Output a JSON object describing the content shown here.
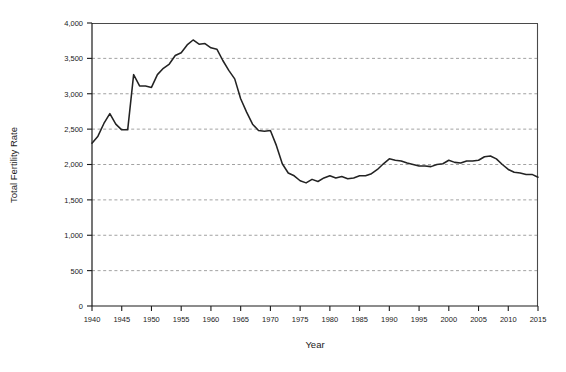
{
  "chart_data": {
    "type": "line",
    "title": "",
    "xlabel": "Year",
    "ylabel": "Total Fertility Rate",
    "xlim": [
      1940,
      2015
    ],
    "ylim": [
      0,
      4000
    ],
    "grid": true,
    "legend": "none",
    "xticks": [
      1940,
      1945,
      1950,
      1955,
      1960,
      1965,
      1970,
      1975,
      1980,
      1985,
      1990,
      1995,
      2000,
      2005,
      2010,
      2015
    ],
    "xtick_labels": [
      "1940",
      "1945",
      "1950",
      "1955",
      "1960",
      "1965",
      "1970",
      "1975",
      "1980",
      "1985",
      "1990",
      "1995",
      "2000",
      "2005",
      "2010",
      "2015"
    ],
    "yticks": [
      0,
      500,
      1000,
      1500,
      2000,
      2500,
      3000,
      3500,
      4000
    ],
    "ytick_labels": [
      "0",
      "500",
      "1,000",
      "1,500",
      "2,000",
      "2,500",
      "3,000",
      "3,500",
      "4,000"
    ],
    "line_color": "#232323",
    "series": [
      {
        "name": "Total Fertility Rate",
        "x": [
          1940,
          1941,
          1942,
          1943,
          1944,
          1945,
          1946,
          1947,
          1948,
          1949,
          1950,
          1951,
          1952,
          1953,
          1954,
          1955,
          1956,
          1957,
          1958,
          1959,
          1960,
          1961,
          1962,
          1963,
          1964,
          1965,
          1966,
          1967,
          1968,
          1969,
          1970,
          1971,
          1972,
          1973,
          1974,
          1975,
          1976,
          1977,
          1978,
          1979,
          1980,
          1981,
          1982,
          1983,
          1984,
          1985,
          1986,
          1987,
          1988,
          1989,
          1990,
          1991,
          1992,
          1993,
          1994,
          1995,
          1996,
          1997,
          1998,
          1999,
          2000,
          2001,
          2002,
          2003,
          2004,
          2005,
          2006,
          2007,
          2008,
          2009,
          2010,
          2011,
          2012,
          2013,
          2014,
          2015
        ],
        "values": [
          2300,
          2400,
          2580,
          2720,
          2570,
          2490,
          2490,
          3270,
          3110,
          3110,
          3090,
          3270,
          3360,
          3420,
          3540,
          3580,
          3690,
          3760,
          3700,
          3710,
          3650,
          3630,
          3470,
          3330,
          3210,
          2930,
          2740,
          2570,
          2480,
          2470,
          2480,
          2270,
          2010,
          1880,
          1840,
          1770,
          1740,
          1790,
          1760,
          1810,
          1840,
          1810,
          1830,
          1800,
          1810,
          1840,
          1840,
          1870,
          1930,
          2010,
          2080,
          2060,
          2050,
          2020,
          2000,
          1980,
          1980,
          1970,
          2000,
          2010,
          2060,
          2030,
          2020,
          2050,
          2050,
          2060,
          2110,
          2120,
          2080,
          2000,
          1930,
          1890,
          1880,
          1860,
          1860,
          1820
        ]
      }
    ]
  },
  "axes": {
    "y_title": "Total Fertility Rate",
    "x_title": "Year"
  }
}
